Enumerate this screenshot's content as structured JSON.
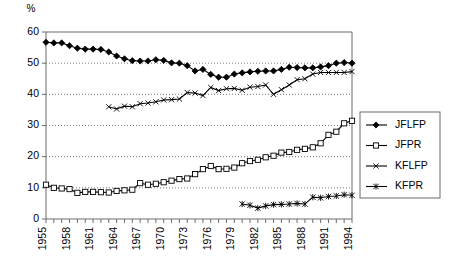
{
  "chart_data": {
    "type": "line",
    "title": "",
    "xlabel": "",
    "ylabel": "%",
    "ylim": [
      0,
      60
    ],
    "ytick_step": 10,
    "yticks": [
      0,
      10,
      20,
      30,
      40,
      50,
      60
    ],
    "xlim": [
      1955,
      1994
    ],
    "xtick_labels": [
      "1955",
      "1958",
      "1961",
      "1964",
      "1967",
      "1970",
      "1973",
      "1976",
      "1979",
      "1982",
      "1985",
      "1988",
      "1991",
      "1994"
    ],
    "xtick_step": 3,
    "x_all": [
      1955,
      1956,
      1957,
      1958,
      1959,
      1960,
      1961,
      1962,
      1963,
      1964,
      1965,
      1966,
      1967,
      1968,
      1969,
      1970,
      1971,
      1972,
      1973,
      1974,
      1975,
      1976,
      1977,
      1978,
      1979,
      1980,
      1981,
      1982,
      1983,
      1984,
      1985,
      1986,
      1987,
      1988,
      1989,
      1990,
      1991,
      1992,
      1993,
      1994
    ],
    "grid": "horizontal-dotted",
    "legend_position": "right-outside",
    "series": [
      {
        "name": "JFLFP",
        "marker": "filled-diamond",
        "x": [
          1955,
          1956,
          1957,
          1958,
          1959,
          1960,
          1961,
          1962,
          1963,
          1964,
          1965,
          1966,
          1967,
          1968,
          1969,
          1970,
          1971,
          1972,
          1973,
          1974,
          1975,
          1976,
          1977,
          1978,
          1979,
          1980,
          1981,
          1982,
          1983,
          1984,
          1985,
          1986,
          1987,
          1988,
          1989,
          1990,
          1991,
          1992,
          1993,
          1994
        ],
        "values": [
          56.7,
          56.5,
          56.5,
          55.6,
          54.8,
          54.5,
          54.5,
          54.4,
          53.6,
          52.3,
          51.4,
          50.8,
          50.7,
          50.7,
          51.1,
          50.9,
          50.1,
          50.0,
          49.2,
          47.5,
          48.0,
          46.4,
          45.5,
          45.5,
          46.5,
          46.9,
          47.2,
          47.4,
          47.5,
          47.5,
          48.0,
          48.7,
          48.6,
          48.5,
          48.5,
          48.8,
          49.2,
          50.0,
          50.2,
          50.0
        ]
      },
      {
        "name": "JFPR",
        "marker": "open-square",
        "x": [
          1955,
          1956,
          1957,
          1958,
          1959,
          1960,
          1961,
          1962,
          1963,
          1964,
          1965,
          1966,
          1967,
          1968,
          1969,
          1970,
          1971,
          1972,
          1973,
          1974,
          1975,
          1976,
          1977,
          1978,
          1979,
          1980,
          1981,
          1982,
          1983,
          1984,
          1985,
          1986,
          1987,
          1988,
          1989,
          1990,
          1991,
          1992,
          1993,
          1994
        ],
        "values": [
          11.0,
          10.0,
          9.8,
          9.6,
          8.4,
          8.7,
          8.7,
          8.6,
          8.5,
          9.0,
          9.2,
          9.4,
          11.5,
          11.0,
          11.3,
          11.8,
          12.3,
          12.8,
          13.0,
          14.4,
          16.0,
          17.0,
          16.0,
          16.1,
          16.5,
          17.9,
          18.6,
          19.0,
          19.8,
          20.3,
          21.3,
          21.5,
          22.2,
          22.5,
          23.0,
          24.3,
          27.0,
          28.0,
          30.7,
          31.5
        ]
      },
      {
        "name": "KFLFP",
        "marker": "cross-x",
        "x": [
          1963,
          1964,
          1965,
          1966,
          1967,
          1968,
          1969,
          1970,
          1971,
          1972,
          1973,
          1974,
          1975,
          1976,
          1977,
          1978,
          1979,
          1980,
          1981,
          1982,
          1983,
          1984,
          1985,
          1986,
          1987,
          1988,
          1989,
          1990,
          1991,
          1992,
          1993,
          1994
        ],
        "values": [
          36.0,
          35.3,
          36.2,
          36.0,
          37.0,
          37.2,
          37.6,
          38.2,
          38.3,
          38.5,
          40.6,
          40.4,
          39.6,
          42.2,
          41.2,
          41.8,
          41.9,
          41.3,
          42.3,
          42.5,
          43.0,
          40.0,
          41.5,
          43.0,
          44.7,
          45.0,
          46.5,
          47.0,
          47.0,
          47.0,
          47.0,
          47.3
        ]
      },
      {
        "name": "KFPR",
        "marker": "asterisk",
        "x": [
          1980,
          1981,
          1982,
          1983,
          1984,
          1985,
          1986,
          1987,
          1988,
          1989,
          1990,
          1991,
          1992,
          1993,
          1994
        ],
        "values": [
          4.8,
          4.4,
          3.5,
          4.2,
          4.6,
          4.7,
          4.8,
          5.0,
          4.8,
          7.0,
          6.8,
          7.2,
          7.4,
          7.8,
          7.6
        ]
      }
    ]
  },
  "legend": {
    "items": [
      {
        "label": "JFLFP",
        "marker": "filled-diamond"
      },
      {
        "label": "JFPR",
        "marker": "open-square"
      },
      {
        "label": "KFLFP",
        "marker": "cross-x"
      },
      {
        "label": "KFPR",
        "marker": "asterisk"
      }
    ]
  },
  "axis": {
    "y_unit_label": "%"
  }
}
